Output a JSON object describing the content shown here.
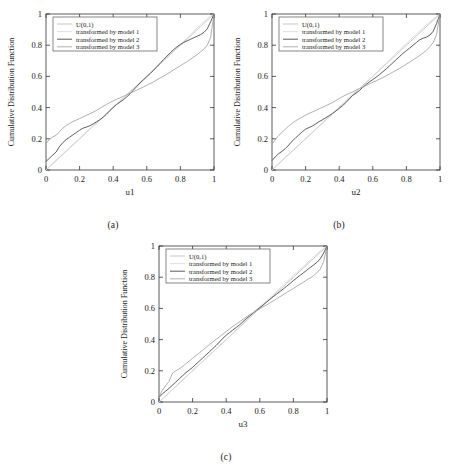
{
  "figure": {
    "background": "#ffffff",
    "panels": [
      {
        "key": "a",
        "caption": "(a)"
      },
      {
        "key": "b",
        "caption": "(b)"
      },
      {
        "key": "c",
        "caption": "(c)"
      }
    ]
  },
  "style": {
    "axis_color": "#333333",
    "text_color": "#1a1a1a",
    "legend_border": "#555555",
    "legend_bg": "#ffffff",
    "series_colors": [
      "#b8b8b8",
      "#d8d8d8",
      "#4a4a4a",
      "#9a9a9a"
    ]
  },
  "chart_data": [
    {
      "type": "line",
      "panel": "a",
      "title": "",
      "caption": "(a)",
      "xlabel": "u1",
      "ylabel": "Cumulative Distribution Function",
      "xlim": [
        0,
        1
      ],
      "ylim": [
        0,
        1
      ],
      "xticks": [
        0,
        0.2,
        0.4,
        0.6,
        0.8,
        1
      ],
      "xticklabels": [
        "0",
        "0.2",
        "0.4",
        "0.6",
        "0.8",
        "1"
      ],
      "yticks": [
        0,
        0.2,
        0.4,
        0.6,
        0.8,
        1
      ],
      "yticklabels": [
        "0",
        "0.2",
        "0.4",
        "0.6",
        "0.8",
        "1"
      ],
      "grid": false,
      "legend_position": "upper left",
      "legend": [
        "U(0,1)",
        "transformed by model 1",
        "transformed by model 2",
        "transformed by model 3"
      ],
      "x": [
        0,
        0.02,
        0.04,
        0.06,
        0.08,
        0.1,
        0.12,
        0.14,
        0.16,
        0.18,
        0.2,
        0.22,
        0.24,
        0.26,
        0.28,
        0.3,
        0.32,
        0.34,
        0.36,
        0.38,
        0.4,
        0.42,
        0.44,
        0.46,
        0.48,
        0.5,
        0.52,
        0.54,
        0.56,
        0.58,
        0.6,
        0.62,
        0.64,
        0.66,
        0.68,
        0.7,
        0.72,
        0.74,
        0.76,
        0.78,
        0.8,
        0.82,
        0.84,
        0.86,
        0.88,
        0.9,
        0.92,
        0.94,
        0.96,
        0.98,
        1.0
      ],
      "series": [
        {
          "name": "U(0,1)",
          "values": [
            0,
            0.02,
            0.04,
            0.06,
            0.08,
            0.1,
            0.12,
            0.14,
            0.16,
            0.18,
            0.2,
            0.22,
            0.24,
            0.26,
            0.28,
            0.3,
            0.32,
            0.34,
            0.36,
            0.38,
            0.4,
            0.42,
            0.44,
            0.46,
            0.48,
            0.5,
            0.52,
            0.54,
            0.56,
            0.58,
            0.6,
            0.62,
            0.64,
            0.66,
            0.68,
            0.7,
            0.72,
            0.74,
            0.76,
            0.78,
            0.8,
            0.82,
            0.84,
            0.86,
            0.88,
            0.9,
            0.92,
            0.94,
            0.96,
            0.98,
            1.0
          ]
        },
        {
          "name": "transformed by model 1",
          "values": [
            0,
            0.022,
            0.043,
            0.063,
            0.083,
            0.103,
            0.123,
            0.143,
            0.163,
            0.183,
            0.203,
            0.223,
            0.243,
            0.263,
            0.283,
            0.303,
            0.323,
            0.343,
            0.363,
            0.383,
            0.403,
            0.423,
            0.443,
            0.463,
            0.483,
            0.503,
            0.523,
            0.543,
            0.563,
            0.583,
            0.603,
            0.623,
            0.643,
            0.663,
            0.683,
            0.703,
            0.723,
            0.743,
            0.763,
            0.783,
            0.803,
            0.823,
            0.845,
            0.867,
            0.889,
            0.911,
            0.933,
            0.953,
            0.97,
            0.986,
            1.0
          ]
        },
        {
          "name": "transformed by model 2",
          "values": [
            0.055,
            0.075,
            0.095,
            0.115,
            0.15,
            0.175,
            0.195,
            0.21,
            0.225,
            0.24,
            0.255,
            0.268,
            0.275,
            0.283,
            0.295,
            0.308,
            0.322,
            0.338,
            0.358,
            0.38,
            0.402,
            0.42,
            0.435,
            0.45,
            0.468,
            0.488,
            0.512,
            0.535,
            0.558,
            0.578,
            0.598,
            0.618,
            0.64,
            0.662,
            0.685,
            0.708,
            0.73,
            0.752,
            0.772,
            0.79,
            0.805,
            0.818,
            0.828,
            0.838,
            0.848,
            0.858,
            0.868,
            0.882,
            0.905,
            0.95,
            1.0
          ]
        },
        {
          "name": "transformed by model 3",
          "values": [
            0.17,
            0.195,
            0.212,
            0.222,
            0.245,
            0.268,
            0.285,
            0.298,
            0.31,
            0.32,
            0.33,
            0.34,
            0.35,
            0.36,
            0.37,
            0.382,
            0.395,
            0.408,
            0.42,
            0.432,
            0.443,
            0.453,
            0.462,
            0.472,
            0.482,
            0.492,
            0.502,
            0.512,
            0.522,
            0.532,
            0.543,
            0.554,
            0.565,
            0.578,
            0.59,
            0.602,
            0.615,
            0.628,
            0.642,
            0.655,
            0.668,
            0.682,
            0.695,
            0.71,
            0.725,
            0.74,
            0.757,
            0.775,
            0.8,
            0.85,
            1.0
          ]
        }
      ]
    },
    {
      "type": "line",
      "panel": "b",
      "title": "",
      "caption": "(b)",
      "xlabel": "u2",
      "ylabel": "Cumulative Distribution Function",
      "xlim": [
        0,
        1
      ],
      "ylim": [
        0,
        1
      ],
      "xticks": [
        0,
        0.2,
        0.4,
        0.6,
        0.8,
        1
      ],
      "xticklabels": [
        "0",
        "0.2",
        "0.4",
        "0.6",
        "0.8",
        "1"
      ],
      "yticks": [
        0,
        0.2,
        0.4,
        0.6,
        0.8,
        1
      ],
      "yticklabels": [
        "0",
        "0.2",
        "0.4",
        "0.6",
        "0.8",
        "1"
      ],
      "grid": false,
      "legend_position": "upper left",
      "legend": [
        "U(0,1)",
        "transformed by model 1",
        "transformed by model 2",
        "transformed by model 3"
      ],
      "x": [
        0,
        0.02,
        0.04,
        0.06,
        0.08,
        0.1,
        0.12,
        0.14,
        0.16,
        0.18,
        0.2,
        0.22,
        0.24,
        0.26,
        0.28,
        0.3,
        0.32,
        0.34,
        0.36,
        0.38,
        0.4,
        0.42,
        0.44,
        0.46,
        0.48,
        0.5,
        0.52,
        0.54,
        0.56,
        0.58,
        0.6,
        0.62,
        0.64,
        0.66,
        0.68,
        0.7,
        0.72,
        0.74,
        0.76,
        0.78,
        0.8,
        0.82,
        0.84,
        0.86,
        0.88,
        0.9,
        0.92,
        0.94,
        0.96,
        0.98,
        1.0
      ],
      "series": [
        {
          "name": "U(0,1)",
          "values": [
            0,
            0.02,
            0.04,
            0.06,
            0.08,
            0.1,
            0.12,
            0.14,
            0.16,
            0.18,
            0.2,
            0.22,
            0.24,
            0.26,
            0.28,
            0.3,
            0.32,
            0.34,
            0.36,
            0.38,
            0.4,
            0.42,
            0.44,
            0.46,
            0.48,
            0.5,
            0.52,
            0.54,
            0.56,
            0.58,
            0.6,
            0.62,
            0.64,
            0.66,
            0.68,
            0.7,
            0.72,
            0.74,
            0.76,
            0.78,
            0.8,
            0.82,
            0.84,
            0.86,
            0.88,
            0.9,
            0.92,
            0.94,
            0.96,
            0.98,
            1.0
          ]
        },
        {
          "name": "transformed by model 1",
          "values": [
            0,
            0.021,
            0.042,
            0.062,
            0.082,
            0.102,
            0.122,
            0.142,
            0.162,
            0.182,
            0.202,
            0.222,
            0.242,
            0.262,
            0.282,
            0.302,
            0.322,
            0.342,
            0.362,
            0.382,
            0.402,
            0.424,
            0.446,
            0.468,
            0.488,
            0.505,
            0.522,
            0.542,
            0.562,
            0.582,
            0.602,
            0.622,
            0.642,
            0.662,
            0.684,
            0.706,
            0.728,
            0.75,
            0.772,
            0.792,
            0.812,
            0.832,
            0.852,
            0.872,
            0.892,
            0.912,
            0.932,
            0.95,
            0.968,
            0.985,
            1.0
          ]
        },
        {
          "name": "transformed by model 2",
          "values": [
            0.06,
            0.085,
            0.105,
            0.12,
            0.138,
            0.16,
            0.185,
            0.205,
            0.225,
            0.245,
            0.262,
            0.272,
            0.282,
            0.295,
            0.31,
            0.322,
            0.335,
            0.348,
            0.362,
            0.378,
            0.395,
            0.412,
            0.432,
            0.455,
            0.478,
            0.492,
            0.508,
            0.53,
            0.548,
            0.565,
            0.58,
            0.595,
            0.612,
            0.63,
            0.648,
            0.668,
            0.688,
            0.708,
            0.728,
            0.748,
            0.765,
            0.782,
            0.8,
            0.818,
            0.835,
            0.845,
            0.852,
            0.865,
            0.89,
            0.94,
            1.0
          ]
        },
        {
          "name": "transformed by model 3",
          "values": [
            0.165,
            0.195,
            0.222,
            0.242,
            0.262,
            0.282,
            0.3,
            0.315,
            0.328,
            0.34,
            0.352,
            0.362,
            0.372,
            0.382,
            0.392,
            0.402,
            0.412,
            0.422,
            0.432,
            0.445,
            0.458,
            0.47,
            0.482,
            0.492,
            0.5,
            0.512,
            0.522,
            0.532,
            0.542,
            0.552,
            0.562,
            0.572,
            0.582,
            0.592,
            0.604,
            0.616,
            0.628,
            0.64,
            0.652,
            0.665,
            0.678,
            0.692,
            0.706,
            0.72,
            0.735,
            0.75,
            0.768,
            0.79,
            0.818,
            0.87,
            1.0
          ]
        }
      ]
    },
    {
      "type": "line",
      "panel": "c",
      "title": "",
      "caption": "(c)",
      "xlabel": "u3",
      "ylabel": "Cumulative Distribution Function",
      "xlim": [
        0,
        1
      ],
      "ylim": [
        0,
        1
      ],
      "xticks": [
        0,
        0.2,
        0.4,
        0.6,
        0.8,
        1
      ],
      "xticklabels": [
        "0",
        "0.2",
        "0.4",
        "0.6",
        "0.8",
        "1"
      ],
      "yticks": [
        0,
        0.2,
        0.4,
        0.6,
        0.8,
        1
      ],
      "yticklabels": [
        "0",
        "0.2",
        "0.4",
        "0.6",
        "0.8",
        "1"
      ],
      "grid": false,
      "legend_position": "upper left",
      "legend": [
        "U(0,1)",
        "transformed by model 1",
        "transformed by model 2",
        "transformed by model 3"
      ],
      "x": [
        0,
        0.02,
        0.04,
        0.06,
        0.08,
        0.1,
        0.12,
        0.14,
        0.16,
        0.18,
        0.2,
        0.22,
        0.24,
        0.26,
        0.28,
        0.3,
        0.32,
        0.34,
        0.36,
        0.38,
        0.4,
        0.42,
        0.44,
        0.46,
        0.48,
        0.5,
        0.52,
        0.54,
        0.56,
        0.58,
        0.6,
        0.62,
        0.64,
        0.66,
        0.68,
        0.7,
        0.72,
        0.74,
        0.76,
        0.78,
        0.8,
        0.82,
        0.84,
        0.86,
        0.88,
        0.9,
        0.92,
        0.94,
        0.96,
        0.98,
        1.0
      ],
      "series": [
        {
          "name": "U(0,1)",
          "values": [
            0,
            0.02,
            0.04,
            0.06,
            0.08,
            0.1,
            0.12,
            0.14,
            0.16,
            0.18,
            0.2,
            0.22,
            0.24,
            0.26,
            0.28,
            0.3,
            0.32,
            0.34,
            0.36,
            0.38,
            0.4,
            0.42,
            0.44,
            0.46,
            0.48,
            0.5,
            0.52,
            0.54,
            0.56,
            0.58,
            0.6,
            0.62,
            0.64,
            0.66,
            0.68,
            0.7,
            0.72,
            0.74,
            0.76,
            0.78,
            0.8,
            0.82,
            0.84,
            0.86,
            0.88,
            0.9,
            0.92,
            0.94,
            0.96,
            0.98,
            1.0
          ]
        },
        {
          "name": "transformed by model 1",
          "values": [
            0,
            0.02,
            0.04,
            0.06,
            0.08,
            0.1,
            0.12,
            0.14,
            0.16,
            0.18,
            0.2,
            0.22,
            0.24,
            0.26,
            0.28,
            0.3,
            0.32,
            0.34,
            0.36,
            0.38,
            0.4,
            0.42,
            0.44,
            0.46,
            0.482,
            0.505,
            0.528,
            0.55,
            0.57,
            0.59,
            0.61,
            0.63,
            0.65,
            0.67,
            0.69,
            0.71,
            0.73,
            0.75,
            0.77,
            0.79,
            0.81,
            0.83,
            0.85,
            0.87,
            0.89,
            0.91,
            0.93,
            0.95,
            0.968,
            0.985,
            1.0
          ]
        },
        {
          "name": "transformed by model 2",
          "values": [
            0.03,
            0.052,
            0.07,
            0.088,
            0.108,
            0.128,
            0.148,
            0.168,
            0.188,
            0.205,
            0.222,
            0.242,
            0.262,
            0.282,
            0.302,
            0.322,
            0.342,
            0.362,
            0.385,
            0.408,
            0.428,
            0.445,
            0.462,
            0.478,
            0.495,
            0.515,
            0.535,
            0.552,
            0.57,
            0.588,
            0.605,
            0.622,
            0.64,
            0.658,
            0.675,
            0.692,
            0.708,
            0.725,
            0.742,
            0.76,
            0.778,
            0.795,
            0.812,
            0.828,
            0.845,
            0.862,
            0.878,
            0.895,
            0.918,
            0.955,
            1.0
          ]
        },
        {
          "name": "transformed by model 3",
          "values": [
            0.035,
            0.075,
            0.105,
            0.132,
            0.185,
            0.2,
            0.212,
            0.228,
            0.245,
            0.262,
            0.28,
            0.298,
            0.315,
            0.332,
            0.35,
            0.368,
            0.385,
            0.402,
            0.418,
            0.435,
            0.452,
            0.468,
            0.485,
            0.5,
            0.515,
            0.53,
            0.545,
            0.56,
            0.572,
            0.585,
            0.598,
            0.61,
            0.622,
            0.635,
            0.648,
            0.662,
            0.675,
            0.688,
            0.702,
            0.715,
            0.728,
            0.742,
            0.755,
            0.768,
            0.782,
            0.795,
            0.81,
            0.828,
            0.852,
            0.9,
            1.0
          ]
        }
      ]
    }
  ]
}
